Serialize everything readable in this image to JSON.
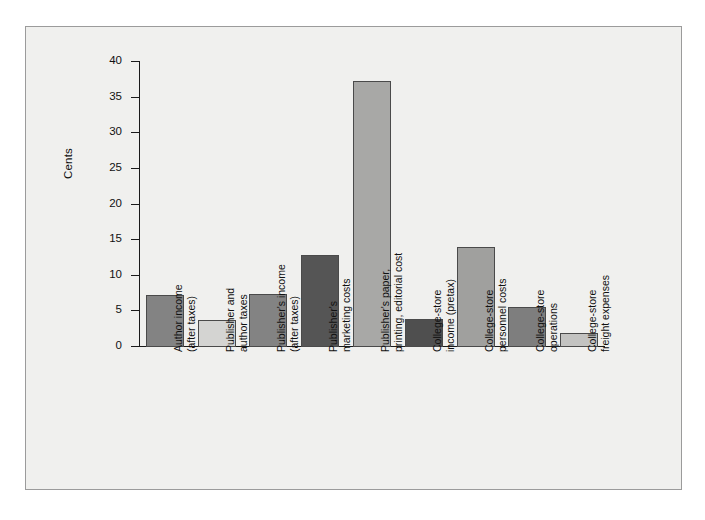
{
  "figure": {
    "background_color": "#f0f0ee",
    "frame_color": "#9b9b9b",
    "axis_color": "#1a1a1a"
  },
  "chart_data": {
    "type": "bar",
    "title": "",
    "xlabel": "",
    "ylabel": "Cents",
    "ylim": [
      0,
      40
    ],
    "yticks": [
      0,
      5,
      10,
      15,
      20,
      25,
      30,
      35,
      40
    ],
    "ytick_labels": [
      "0",
      "5",
      "10",
      "15",
      "20",
      "25",
      "30",
      "35",
      "40"
    ],
    "grid": false,
    "legend": null,
    "categories": [
      "Author income (after taxes)",
      "Publisher and author taxes",
      "Publisher's income (after taxes)",
      "Publisher's marketing costs",
      "Publisher's paper, printing, editorial cost",
      "College-store income (pretax)",
      "College-store personnel costs",
      "College-store operations",
      "College-store freight expenses"
    ],
    "category_lines": [
      [
        "Author income",
        "(after taxes)"
      ],
      [
        "Publisher and",
        "author taxes"
      ],
      [
        "Publisher's income",
        "(after taxes)"
      ],
      [
        "Publisher's",
        "marketing costs"
      ],
      [
        "Publisher's paper,",
        "printing, editorial cost"
      ],
      [
        "College-store",
        "income (pretax)"
      ],
      [
        "College-store",
        "personnel costs"
      ],
      [
        "College-store",
        "operations"
      ],
      [
        "College-store",
        "freight expenses"
      ]
    ],
    "values": [
      7.3,
      3.8,
      7.5,
      12.9,
      37.3,
      3.9,
      14.0,
      5.6,
      1.9
    ],
    "bar_colors": [
      "#838383",
      "#d4d4d2",
      "#838383",
      "#555555",
      "#a8a8a6",
      "#4f4f4f",
      "#a0a09e",
      "#7e7e7e",
      "#c3c3c1"
    ]
  }
}
